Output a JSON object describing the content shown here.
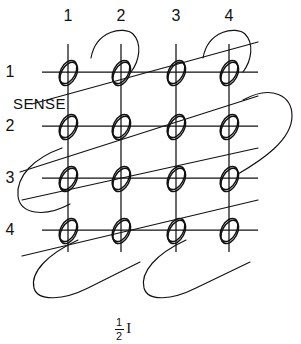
{
  "figure": {
    "line_color": "#111111",
    "background_color": "#ffffff",
    "column_labels": [
      "1",
      "2",
      "3",
      "4"
    ],
    "row_labels": [
      "1",
      "2",
      "3",
      "4"
    ],
    "sense_wire_label": "SENSE",
    "current_label": {
      "numerator": "1",
      "denominator": "2",
      "symbol": "I"
    },
    "grid": {
      "columns": 4,
      "rows": 4,
      "core_count": 16,
      "column_x": [
        68,
        121,
        176,
        229
      ],
      "row_y": [
        72,
        126,
        178,
        230
      ],
      "core_shape": "tilted-ellipse"
    }
  }
}
